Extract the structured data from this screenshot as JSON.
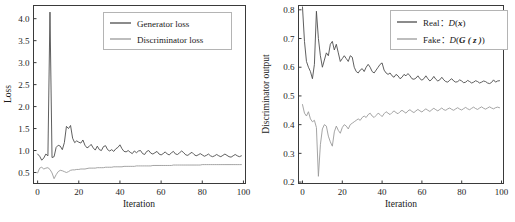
{
  "figure": {
    "background": "#ffffff",
    "panels": [
      "generator-discriminator-loss",
      "discriminator-output"
    ]
  },
  "colors": {
    "series_dark": "#4d4d4d",
    "series_light": "#9a9a9a",
    "axis": "#3a3a3a",
    "text": "#1a1a1a"
  },
  "chart_data": [
    {
      "id": "loss-chart",
      "type": "line",
      "title": "",
      "xlabel": "Iteration",
      "ylabel": "Loss",
      "xlim": [
        -2,
        101
      ],
      "ylim": [
        0.25,
        4.3
      ],
      "xticks": [
        0,
        20,
        40,
        60,
        80,
        100
      ],
      "yticks": [
        0.5,
        1.0,
        1.5,
        2.0,
        2.5,
        3.0,
        3.5,
        4.0
      ],
      "xticklabels": [
        "0",
        "20",
        "40",
        "60",
        "80",
        "100"
      ],
      "yticklabels": [
        "0.5",
        "1.0",
        "1.5",
        "2.0",
        "2.5",
        "3.0",
        "3.5",
        "4.0"
      ],
      "grid": false,
      "legend_position": "upper right",
      "x": [
        0,
        1,
        2,
        3,
        4,
        5,
        6,
        7,
        8,
        9,
        10,
        11,
        12,
        13,
        14,
        15,
        16,
        17,
        18,
        19,
        20,
        21,
        22,
        23,
        24,
        25,
        26,
        27,
        28,
        29,
        30,
        31,
        32,
        33,
        34,
        35,
        36,
        37,
        38,
        39,
        40,
        41,
        42,
        43,
        44,
        45,
        46,
        47,
        48,
        49,
        50,
        51,
        52,
        53,
        54,
        55,
        56,
        57,
        58,
        59,
        60,
        61,
        62,
        63,
        64,
        65,
        66,
        67,
        68,
        69,
        70,
        71,
        72,
        73,
        74,
        75,
        76,
        77,
        78,
        79,
        80,
        81,
        82,
        83,
        84,
        85,
        86,
        87,
        88,
        89,
        90,
        91,
        92,
        93,
        94,
        95,
        96,
        97,
        98,
        99
      ],
      "series": [
        {
          "name": "Generator loss",
          "color": "#4d4d4d",
          "values": [
            0.92,
            0.87,
            0.78,
            0.83,
            0.92,
            0.88,
            4.15,
            0.84,
            0.86,
            1.07,
            1.12,
            1.1,
            1.02,
            1.18,
            1.55,
            1.5,
            1.57,
            1.28,
            1.18,
            1.22,
            1.19,
            1.17,
            1.24,
            1.12,
            1.06,
            1.09,
            1.14,
            1.06,
            1.01,
            1.1,
            1.02,
            1.0,
            1.09,
            1.11,
            1.02,
            0.99,
            1.02,
            0.98,
            1.04,
            1.07,
            1.13,
            1.04,
            0.98,
            0.97,
            1.0,
            0.96,
            0.93,
            0.99,
            0.95,
            0.99,
            1.0,
            0.93,
            0.91,
            0.98,
            1.0,
            0.94,
            0.92,
            0.95,
            0.98,
            0.92,
            0.9,
            0.93,
            0.97,
            0.92,
            0.9,
            0.95,
            0.98,
            0.92,
            0.91,
            0.95,
            0.99,
            0.95,
            0.9,
            0.89,
            0.93,
            0.96,
            0.91,
            0.88,
            0.9,
            0.93,
            0.9,
            0.87,
            0.89,
            0.92,
            0.88,
            0.86,
            0.88,
            0.91,
            0.88,
            0.86,
            0.89,
            0.92,
            0.89,
            0.86,
            0.85,
            0.88,
            0.91,
            0.88,
            0.86,
            0.88
          ]
        },
        {
          "name": "Discriminator loss",
          "color": "#9a9a9a",
          "values": [
            0.49,
            0.6,
            0.62,
            0.58,
            0.6,
            0.61,
            0.57,
            0.49,
            0.36,
            0.45,
            0.52,
            0.55,
            0.54,
            0.52,
            0.5,
            0.52,
            0.55,
            0.56,
            0.56,
            0.57,
            0.57,
            0.58,
            0.58,
            0.58,
            0.59,
            0.6,
            0.6,
            0.6,
            0.6,
            0.61,
            0.61,
            0.61,
            0.61,
            0.62,
            0.62,
            0.62,
            0.62,
            0.63,
            0.63,
            0.63,
            0.63,
            0.63,
            0.64,
            0.64,
            0.64,
            0.64,
            0.64,
            0.64,
            0.65,
            0.65,
            0.65,
            0.65,
            0.65,
            0.65,
            0.65,
            0.65,
            0.66,
            0.66,
            0.66,
            0.66,
            0.66,
            0.66,
            0.66,
            0.66,
            0.66,
            0.66,
            0.67,
            0.67,
            0.67,
            0.67,
            0.67,
            0.67,
            0.67,
            0.67,
            0.67,
            0.67,
            0.67,
            0.67,
            0.67,
            0.67,
            0.68,
            0.68,
            0.68,
            0.68,
            0.68,
            0.68,
            0.68,
            0.68,
            0.68,
            0.68,
            0.68,
            0.68,
            0.68,
            0.68,
            0.68,
            0.68,
            0.68,
            0.68,
            0.68,
            0.68
          ]
        }
      ]
    },
    {
      "id": "discriminator-output-chart",
      "type": "line",
      "title": "",
      "xlabel": "Iteration",
      "ylabel": "Discriminator output",
      "xlim": [
        -2,
        101
      ],
      "ylim": [
        0.195,
        0.815
      ],
      "xticks": [
        0,
        20,
        40,
        60,
        80,
        100
      ],
      "yticks": [
        0.2,
        0.3,
        0.4,
        0.5,
        0.6,
        0.7,
        0.8
      ],
      "xticklabels": [
        "0",
        "20",
        "40",
        "60",
        "80",
        "100"
      ],
      "yticklabels": [
        "0.2",
        "0.3",
        "0.4",
        "0.5",
        "0.6",
        "0.7",
        "0.8"
      ],
      "grid": false,
      "legend_position": "upper right",
      "x": [
        0,
        1,
        2,
        3,
        4,
        5,
        6,
        7,
        8,
        9,
        10,
        11,
        12,
        13,
        14,
        15,
        16,
        17,
        18,
        19,
        20,
        21,
        22,
        23,
        24,
        25,
        26,
        27,
        28,
        29,
        30,
        31,
        32,
        33,
        34,
        35,
        36,
        37,
        38,
        39,
        40,
        41,
        42,
        43,
        44,
        45,
        46,
        47,
        48,
        49,
        50,
        51,
        52,
        53,
        54,
        55,
        56,
        57,
        58,
        59,
        60,
        61,
        62,
        63,
        64,
        65,
        66,
        67,
        68,
        69,
        70,
        71,
        72,
        73,
        74,
        75,
        76,
        77,
        78,
        79,
        80,
        81,
        82,
        83,
        84,
        85,
        86,
        87,
        88,
        89,
        90,
        91,
        92,
        93,
        94,
        95,
        96,
        97,
        98,
        99
      ],
      "series": [
        {
          "name_prefix": "Real",
          "name_math": "D(x)",
          "color": "#4d4d4d",
          "values": [
            0.81,
            0.69,
            0.62,
            0.6,
            0.585,
            0.56,
            0.61,
            0.795,
            0.7,
            0.64,
            0.6,
            0.625,
            0.65,
            0.64,
            0.68,
            0.69,
            0.66,
            0.68,
            0.65,
            0.62,
            0.63,
            0.64,
            0.63,
            0.62,
            0.64,
            0.635,
            0.6,
            0.585,
            0.58,
            0.59,
            0.595,
            0.585,
            0.6,
            0.61,
            0.6,
            0.585,
            0.58,
            0.59,
            0.6,
            0.61,
            0.615,
            0.59,
            0.58,
            0.575,
            0.58,
            0.57,
            0.565,
            0.575,
            0.57,
            0.56,
            0.565,
            0.575,
            0.57,
            0.578,
            0.57,
            0.56,
            0.558,
            0.562,
            0.57,
            0.56,
            0.555,
            0.56,
            0.57,
            0.56,
            0.552,
            0.558,
            0.568,
            0.558,
            0.552,
            0.556,
            0.565,
            0.556,
            0.55,
            0.548,
            0.555,
            0.56,
            0.552,
            0.548,
            0.55,
            0.556,
            0.552,
            0.546,
            0.548,
            0.554,
            0.55,
            0.545,
            0.548,
            0.553,
            0.55,
            0.545,
            0.548,
            0.552,
            0.55,
            0.545,
            0.543,
            0.547,
            0.556,
            0.548,
            0.552,
            0.553
          ]
        },
        {
          "name_prefix": "Fake",
          "name_math": "D(G(z))",
          "color": "#9a9a9a",
          "values": [
            0.47,
            0.44,
            0.43,
            0.445,
            0.42,
            0.41,
            0.415,
            0.39,
            0.22,
            0.33,
            0.385,
            0.4,
            0.395,
            0.36,
            0.34,
            0.325,
            0.375,
            0.395,
            0.38,
            0.37,
            0.39,
            0.4,
            0.395,
            0.385,
            0.4,
            0.405,
            0.41,
            0.415,
            0.42,
            0.415,
            0.425,
            0.43,
            0.425,
            0.435,
            0.44,
            0.43,
            0.425,
            0.432,
            0.44,
            0.435,
            0.428,
            0.438,
            0.445,
            0.44,
            0.435,
            0.442,
            0.448,
            0.442,
            0.438,
            0.445,
            0.45,
            0.445,
            0.44,
            0.448,
            0.452,
            0.446,
            0.442,
            0.448,
            0.453,
            0.448,
            0.444,
            0.45,
            0.455,
            0.45,
            0.446,
            0.452,
            0.457,
            0.452,
            0.448,
            0.453,
            0.458,
            0.452,
            0.45,
            0.455,
            0.458,
            0.453,
            0.45,
            0.455,
            0.459,
            0.454,
            0.451,
            0.456,
            0.46,
            0.455,
            0.452,
            0.457,
            0.461,
            0.456,
            0.453,
            0.458,
            0.462,
            0.457,
            0.454,
            0.458,
            0.462,
            0.458,
            0.455,
            0.459,
            0.461,
            0.459
          ]
        }
      ]
    }
  ],
  "legends": {
    "loss": {
      "entries": [
        {
          "label": "Generator loss",
          "color": "#4d4d4d"
        },
        {
          "label": "Discriminator loss",
          "color": "#9a9a9a"
        }
      ]
    },
    "output": {
      "entries": [
        {
          "prefix": "Real",
          "sep": "：",
          "func": "D",
          "open": "(",
          "var": "x",
          "close": ")",
          "color": "#4d4d4d"
        },
        {
          "prefix": "Fake",
          "sep": "：",
          "func": "D",
          "open": "(",
          "var": "G ( z )",
          "close": ")",
          "color": "#9a9a9a"
        }
      ]
    }
  }
}
